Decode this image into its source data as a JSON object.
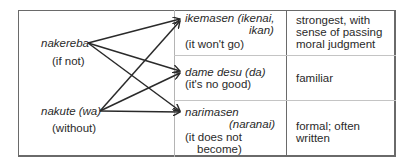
{
  "sources": [
    {
      "term": "nakereba",
      "gloss": "(if not)"
    },
    {
      "term": "nakute (wa)",
      "gloss": "(without)"
    }
  ],
  "targets": [
    {
      "term": "ikemasen (ikenai,",
      "term2": "ikan)",
      "gloss": "(it won't go)",
      "note": [
        "strongest, with",
        "sense of passing",
        "moral judgment"
      ]
    },
    {
      "term": "dame desu (da)",
      "gloss": "(it's no good)",
      "note": [
        "familiar"
      ]
    },
    {
      "term": "narimasen",
      "term2": "(naranai)",
      "gloss": "(it does not",
      "gloss2": "become)",
      "note": [
        "formal; often",
        "written"
      ]
    }
  ],
  "colors": {
    "border": "#6a6a6a",
    "divider": "#b4b4b4",
    "arrow": "#2a2a2a",
    "text": "#2a2a2a"
  }
}
